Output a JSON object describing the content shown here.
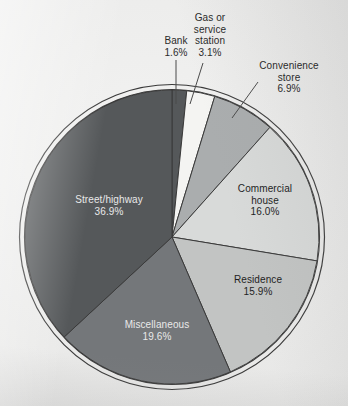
{
  "chart_data": {
    "type": "pie",
    "title": "",
    "subtitle": "",
    "xlabel": "",
    "ylabel": "",
    "legend_position": "none",
    "grid": false,
    "units": "percent",
    "start_angle_deg": 0,
    "direction": "clockwise",
    "total": 100.0,
    "categories": [
      "Bank",
      "Gas or service station",
      "Convenience store",
      "Commercial house",
      "Residence",
      "Miscellaneous",
      "Street/highway"
    ],
    "values": [
      1.6,
      3.1,
      6.9,
      16.0,
      15.9,
      19.6,
      36.9
    ],
    "slices": [
      {
        "label": "Bank",
        "label_lines": [
          "Bank"
        ],
        "value": 1.6,
        "pct_text": "1.6%",
        "color": "#55585a",
        "label_placement": "outside",
        "leader": true
      },
      {
        "label": "Gas or service station",
        "label_lines": [
          "Gas or",
          "service",
          "station"
        ],
        "value": 3.1,
        "pct_text": "3.1%",
        "color": "#f4f4f2",
        "label_placement": "outside",
        "leader": true
      },
      {
        "label": "Convenience store",
        "label_lines": [
          "Convenience",
          "store"
        ],
        "value": 6.9,
        "pct_text": "6.9%",
        "color": "#aaadae",
        "label_placement": "outside",
        "leader": true
      },
      {
        "label": "Commercial house",
        "label_lines": [
          "Commercial",
          "house"
        ],
        "value": 16.0,
        "pct_text": "16.0%",
        "color": "#d8dad9",
        "label_placement": "inside",
        "leader": false
      },
      {
        "label": "Residence",
        "label_lines": [
          "Residence"
        ],
        "value": 15.9,
        "pct_text": "15.9%",
        "color": "#c2c4c3",
        "label_placement": "inside",
        "leader": false
      },
      {
        "label": "Miscellaneous",
        "label_lines": [
          "Miscellaneous"
        ],
        "value": 19.6,
        "pct_text": "19.6%",
        "color": "#74777a",
        "label_placement": "inside",
        "leader": false
      },
      {
        "label": "Street/highway",
        "label_lines": [
          "Street/highway"
        ],
        "value": 36.9,
        "pct_text": "36.9%",
        "color": "#55585a",
        "label_placement": "inside",
        "leader": false
      }
    ]
  },
  "labels": {
    "bank": {
      "line1": "Bank",
      "pct": "1.6%"
    },
    "gas": {
      "line1": "Gas or",
      "line2": "service",
      "line3": "station",
      "pct": "3.1%"
    },
    "convenience": {
      "line1": "Convenience",
      "line2": "store",
      "pct": "6.9%"
    },
    "commercial": {
      "line1": "Commercial",
      "line2": "house",
      "pct": "16.0%"
    },
    "residence": {
      "line1": "Residence",
      "pct": "15.9%"
    },
    "miscellaneous": {
      "line1": "Miscellaneous",
      "pct": "19.6%"
    },
    "street": {
      "line1": "Street/highway",
      "pct": "36.9%"
    }
  },
  "style": {
    "background": "#ececeb",
    "outline": "#3a3a3a",
    "ring_fill": "#e6e6e4",
    "divider": "#3a3a3a",
    "leader": "#4a4a4a"
  }
}
